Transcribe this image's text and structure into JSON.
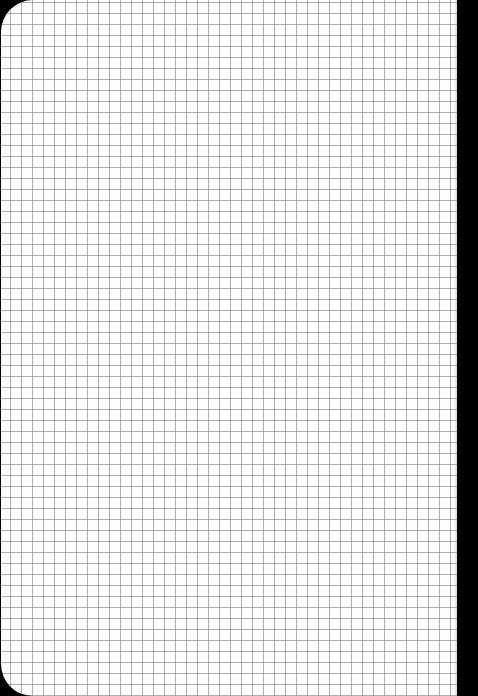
{
  "scene": {
    "subject": "graph paper sheet",
    "background_color": "#000000",
    "paper_color": "#fdfdfd",
    "grid_line_color": "#8a8a8a",
    "grid_spacing_px": 11,
    "corners_rounded": [
      "top-left",
      "bottom-left"
    ]
  }
}
